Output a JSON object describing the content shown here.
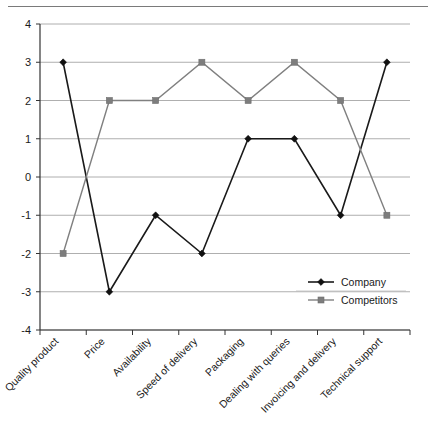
{
  "chart_data": {
    "type": "line",
    "title": "",
    "xlabel": "",
    "ylabel": "",
    "ylim": [
      -4,
      4
    ],
    "yticks": [
      4,
      3,
      2,
      1,
      0,
      -1,
      -2,
      -3,
      -4
    ],
    "grid": true,
    "legend_position": "inside-right-lower",
    "categories": [
      "Quality product",
      "Price",
      "Availability",
      "Speed of delivery",
      "Packaging",
      "Dealing with queries",
      "Invoicing and delivery",
      "Technical support"
    ],
    "series": [
      {
        "name": "Company",
        "color": "#111111",
        "marker": "diamond",
        "values": [
          3,
          -3,
          -1,
          -2,
          1,
          1,
          -1,
          3
        ]
      },
      {
        "name": "Competitors",
        "color": "#7d7d7d",
        "marker": "square",
        "values": [
          -2,
          2,
          2,
          3,
          2,
          3,
          2,
          -1
        ]
      }
    ]
  },
  "legend": {
    "entries": [
      {
        "label": "Company"
      },
      {
        "label": "Competitors"
      }
    ]
  },
  "axis": {
    "y_tick_labels": [
      "4",
      "3",
      "2",
      "1",
      "0",
      "-1",
      "-2",
      "-3",
      "-4"
    ]
  }
}
